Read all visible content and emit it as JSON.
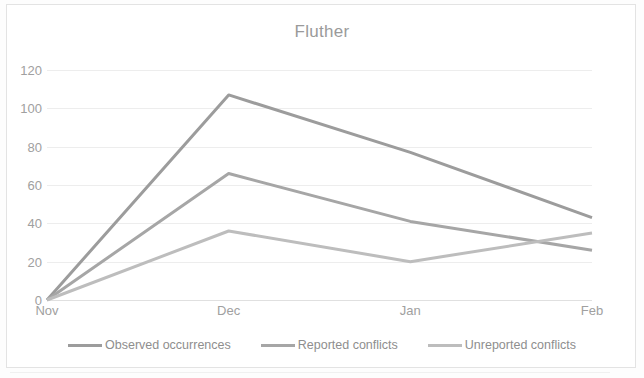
{
  "chart_data": {
    "type": "line",
    "title": "Fluther",
    "xlabel": "",
    "ylabel": "",
    "categories": [
      "Nov",
      "Dec",
      "Jan",
      "Feb"
    ],
    "ylim": [
      0,
      120
    ],
    "yticks": [
      0,
      20,
      40,
      60,
      80,
      100,
      120
    ],
    "grid": true,
    "legend_position": "bottom",
    "series": [
      {
        "name": "Observed occurrences",
        "values": [
          0,
          107,
          77,
          43
        ],
        "color": "#9c9c9c"
      },
      {
        "name": "Reported conflicts",
        "values": [
          0,
          66,
          41,
          26
        ],
        "color": "#a6a6a6"
      },
      {
        "name": "Unreported conflicts",
        "values": [
          0,
          36,
          20,
          35
        ],
        "color": "#bdbdbd"
      }
    ]
  },
  "axis": {
    "y_labels": [
      "120",
      "100",
      "80",
      "60",
      "40",
      "20",
      "0"
    ],
    "x_labels": [
      "Nov",
      "Dec",
      "Jan",
      "Feb"
    ]
  },
  "legend": {
    "items": [
      {
        "label": "Observed occurrences",
        "color": "#9c9c9c"
      },
      {
        "label": "Reported conflicts",
        "color": "#a6a6a6"
      },
      {
        "label": "Unreported conflicts",
        "color": "#bdbdbd"
      }
    ]
  },
  "colors": {
    "gridline": "#ededed",
    "text": "#a0a0a0",
    "title": "#9a9a9a",
    "frame": "#e3e3e3",
    "background": "#ffffff"
  }
}
